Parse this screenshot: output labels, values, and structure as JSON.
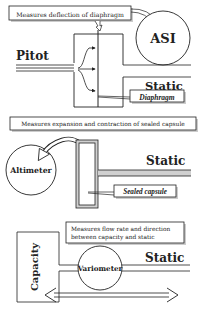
{
  "colors": {
    "line": "#222222",
    "shadow": "#aaaaaa",
    "static_fill": "#d0d0d0",
    "background": "#ffffff"
  },
  "panel_asi": {
    "caption": "Measures deflection of diaphragm",
    "instrument": "ASI",
    "inlet_label": "Pitot",
    "outlet_label": "Static",
    "callout": "Diaphragm"
  },
  "panel_altimeter": {
    "caption": "Measures expansion and contraction of sealed capsule",
    "instrument": "Altimeter",
    "outlet_label": "Static",
    "callout": "Sealed capsule"
  },
  "panel_vsi": {
    "caption_line1": "Measures flow rate and direction",
    "caption_line2": "between capacity and static",
    "instrument": "Variometer",
    "chamber_label": "Capacity",
    "outlet_label": "Static"
  }
}
